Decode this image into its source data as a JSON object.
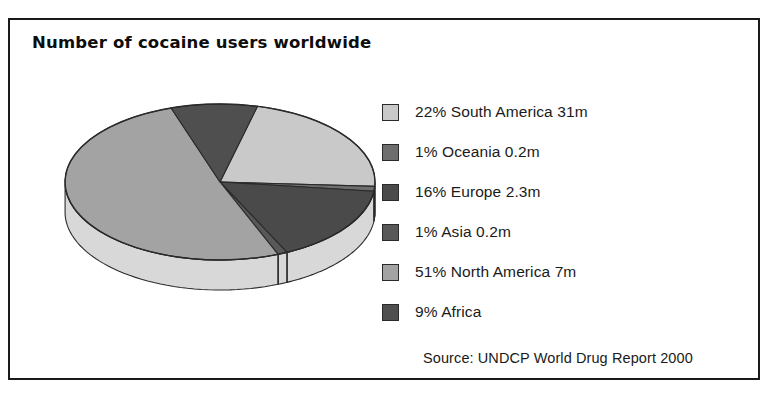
{
  "chart_title": "Number of cocaine users worldwide",
  "source_note": "Source: UNDCP World Drug Report 2000",
  "legend": [
    {
      "label": "22% South America 31m",
      "color": "#c9c9c9",
      "swatch_name": "legend-swatch-south-america"
    },
    {
      "label": "1% Oceania 0.2m",
      "color": "#6e6e6e",
      "swatch_name": "legend-swatch-oceania"
    },
    {
      "label": "16% Europe 2.3m",
      "color": "#4a4a4a",
      "swatch_name": "legend-swatch-europe"
    },
    {
      "label": "1% Asia 0.2m",
      "color": "#585858",
      "swatch_name": "legend-swatch-asia"
    },
    {
      "label": "51% North America 7m",
      "color": "#a3a3a3",
      "swatch_name": "legend-swatch-north-america"
    },
    {
      "label": "9% Africa",
      "color": "#4f4f4f",
      "swatch_name": "legend-swatch-africa"
    }
  ],
  "chart_data": {
    "type": "pie",
    "title": "Number of cocaine users worldwide",
    "subtitle": "",
    "xlabel": "",
    "ylabel": "",
    "legend_position": "right",
    "grid": false,
    "three_d": true,
    "value_unit": "millions of users",
    "annotations": [
      "Source: UNDCP World Drug Report 2000"
    ],
    "categories": [
      "South America",
      "Oceania",
      "Europe",
      "Asia",
      "North America",
      "Africa"
    ],
    "percentages": [
      22,
      1,
      16,
      1,
      51,
      9
    ],
    "values": [
      31,
      0.2,
      2.3,
      0.2,
      7,
      null
    ],
    "value_labels": [
      "31m",
      "0.2m",
      "2.3m",
      "0.2m",
      "7m",
      ""
    ],
    "colors": [
      "#c9c9c9",
      "#6e6e6e",
      "#4a4a4a",
      "#585858",
      "#a3a3a3",
      "#4f4f4f"
    ],
    "slices": [
      {
        "name": "South America",
        "percent": 22,
        "value": 31,
        "value_label": "31m",
        "color": "#c9c9c9"
      },
      {
        "name": "Oceania",
        "percent": 1,
        "value": 0.2,
        "value_label": "0.2m",
        "color": "#6e6e6e"
      },
      {
        "name": "Europe",
        "percent": 16,
        "value": 2.3,
        "value_label": "2.3m",
        "color": "#4a4a4a"
      },
      {
        "name": "Asia",
        "percent": 1,
        "value": 0.2,
        "value_label": "0.2m",
        "color": "#585858"
      },
      {
        "name": "North America",
        "percent": 51,
        "value": 7,
        "value_label": "7m",
        "color": "#a3a3a3"
      },
      {
        "name": "Africa",
        "percent": 9,
        "value": null,
        "value_label": "",
        "color": "#4f4f4f"
      }
    ]
  },
  "pie_geometry": {
    "cx": 188,
    "cy": 92,
    "rx": 155,
    "ry": 78,
    "depth": 30,
    "start_angle_deg": -76,
    "side_wall_color": "#d8d8d8",
    "outline_color": "#2a2a2a"
  }
}
